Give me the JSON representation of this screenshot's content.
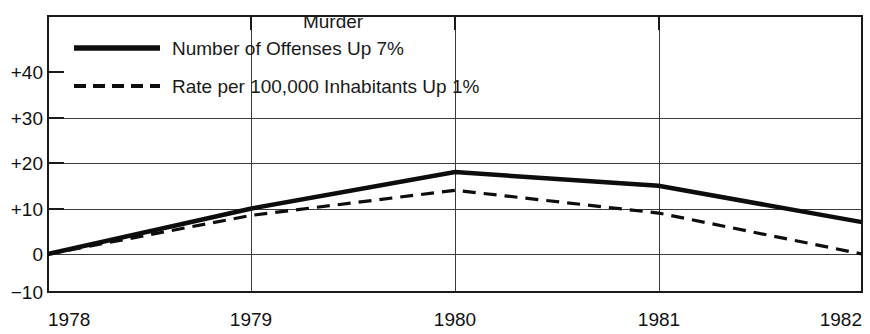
{
  "chart_data": {
    "type": "line",
    "title": "Murder",
    "xlabel": "",
    "ylabel": "",
    "x": [
      1978,
      1979,
      1980,
      1981,
      1982
    ],
    "xticklabels": [
      "1978",
      "1979",
      "1980",
      "1981",
      "1982"
    ],
    "yticklabels": [
      "+40",
      "+30",
      "+20",
      "+10",
      "0",
      "−10"
    ],
    "yticks": [
      40,
      30,
      20,
      10,
      0,
      -10
    ],
    "ylim": [
      -10,
      45
    ],
    "xlim": [
      1978,
      1982
    ],
    "grid": true,
    "legend_position": "upper-left-inside",
    "series": [
      {
        "name": "Number of Offenses Up 7%",
        "style": "solid",
        "color": "#0d0d0d",
        "values": [
          0,
          10,
          18,
          15,
          7
        ]
      },
      {
        "name": "Rate per 100,000 Inhabitants Up 1%",
        "style": "dashed",
        "color": "#0d0d0d",
        "values": [
          0,
          8.5,
          14,
          9,
          0
        ]
      }
    ]
  },
  "legend": {
    "entries": [
      {
        "label": "Number of Offenses Up 7%",
        "style": "solid"
      },
      {
        "label": "Rate per 100,000 Inhabitants Up 1%",
        "style": "dashed"
      }
    ]
  },
  "axis": {
    "y_labels": [
      "+40",
      "+30",
      "+20",
      "+10",
      "0",
      "−10"
    ],
    "x_labels": [
      "1978",
      "1979",
      "1980",
      "1981",
      "1982"
    ]
  },
  "colors": {
    "background": "#ffffff",
    "ink": "#0d0d0d",
    "grid": "#3a3a3a"
  }
}
